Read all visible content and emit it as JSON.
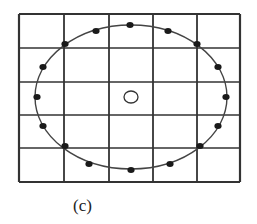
{
  "figure": {
    "caption": "(c)",
    "grid": {
      "x_lines": [
        19,
        64,
        109,
        153,
        197,
        240
      ],
      "y_lines": [
        14,
        48,
        82,
        115,
        148,
        182
      ],
      "color": "#333333"
    },
    "ellipse": {
      "cx": 131,
      "cy": 97,
      "rx": 96,
      "ry": 72,
      "color": "#444444"
    },
    "dots": [
      [
        130,
        25
      ],
      [
        96,
        31
      ],
      [
        168,
        31
      ],
      [
        65,
        44
      ],
      [
        197,
        44
      ],
      [
        43,
        67
      ],
      [
        218,
        67
      ],
      [
        37,
        97
      ],
      [
        226,
        97
      ],
      [
        43,
        126
      ],
      [
        218,
        126
      ],
      [
        65,
        146
      ],
      [
        200,
        146
      ],
      [
        89,
        164
      ],
      [
        170,
        164
      ],
      [
        131,
        170
      ]
    ],
    "center_marker": {
      "cx": 131,
      "cy": 97,
      "rx": 7,
      "ry": 6
    }
  }
}
